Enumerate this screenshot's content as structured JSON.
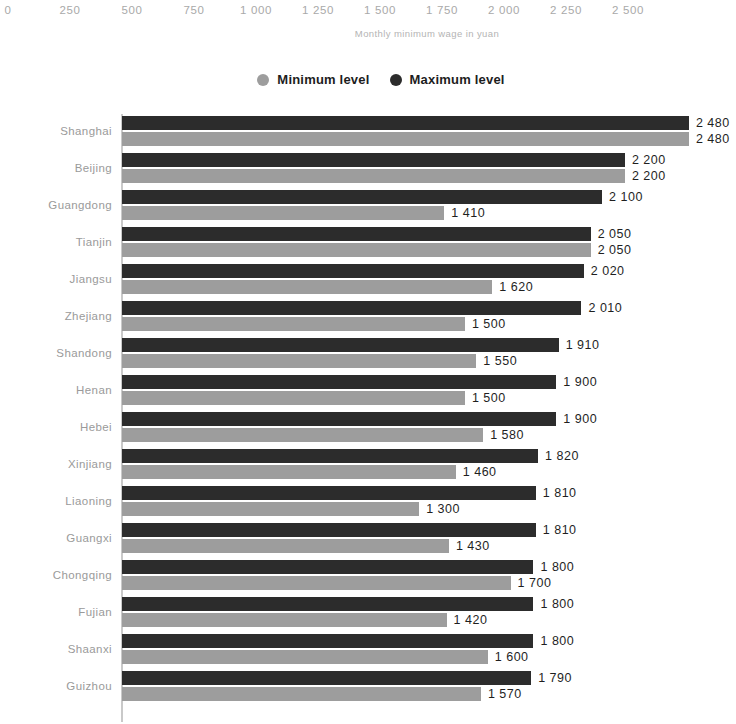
{
  "axis": {
    "caption": "Monthly minimum wage in yuan",
    "ticks": [
      "0",
      "250",
      "500",
      "750",
      "1 000",
      "1 250",
      "1 500",
      "1 750",
      "2 000",
      "2 250",
      "2 500"
    ],
    "tick_values": [
      0,
      250,
      500,
      750,
      1000,
      1250,
      1500,
      1750,
      2000,
      2250,
      2500
    ]
  },
  "legend": {
    "items": [
      {
        "label": "Minimum level",
        "color": "#9d9d9d",
        "icon": "circle-marker-icon"
      },
      {
        "label": "Maximum level",
        "color": "#2c2c2c",
        "icon": "circle-marker-icon"
      }
    ]
  },
  "colors": {
    "minimum": "#9d9d9d",
    "maximum": "#2c2c2c",
    "axis": "#c9c9c9",
    "tick_text": "#a9a9a9",
    "category_text": "#9a9a9a",
    "value_text": "#1f1f1f"
  },
  "chart_data": {
    "type": "bar",
    "title": "",
    "subtitle": "",
    "xlabel": "Monthly minimum wage in yuan",
    "ylabel": "",
    "orientation": "horizontal",
    "grouped": true,
    "grid": false,
    "legend_position": "top-center",
    "xlim": [
      0,
      2500
    ],
    "xticks": [
      0,
      250,
      500,
      750,
      1000,
      1250,
      1500,
      1750,
      2000,
      2250,
      2500
    ],
    "xticklabels": [
      "0",
      "250",
      "500",
      "750",
      "1 000",
      "1 250",
      "1 500",
      "1 750",
      "2 000",
      "2 250",
      "2 500"
    ],
    "categories": [
      "Shanghai",
      "Beijing",
      "Guangdong",
      "Tianjin",
      "Jiangsu",
      "Zhejiang",
      "Shandong",
      "Henan",
      "Hebei",
      "Xinjiang",
      "Liaoning",
      "Guangxi",
      "Chongqing",
      "Fujian",
      "Shaanxi",
      "Guizhou"
    ],
    "series": [
      {
        "name": "Maximum level",
        "color": "#2c2c2c",
        "values": [
          2480,
          2200,
          2100,
          2050,
          2020,
          2010,
          1910,
          1900,
          1900,
          1820,
          1810,
          1810,
          1800,
          1800,
          1800,
          1790
        ],
        "labels": [
          "2 480",
          "2 200",
          "2 100",
          "2 050",
          "2 020",
          "2 010",
          "1 910",
          "1 900",
          "1 900",
          "1 820",
          "1 810",
          "1 810",
          "1 800",
          "1 800",
          "1 800",
          "1 790"
        ]
      },
      {
        "name": "Minimum level",
        "color": "#9d9d9d",
        "values": [
          2480,
          2200,
          1410,
          2050,
          1620,
          1500,
          1550,
          1500,
          1580,
          1460,
          1300,
          1430,
          1700,
          1420,
          1600,
          1570
        ],
        "labels": [
          "2 480",
          "2 200",
          "1 410",
          "2 050",
          "1 620",
          "1 500",
          "1 550",
          "1 500",
          "1 580",
          "1 460",
          "1 300",
          "1 430",
          "1 700",
          "1 420",
          "1 600",
          "1 570"
        ]
      }
    ]
  }
}
